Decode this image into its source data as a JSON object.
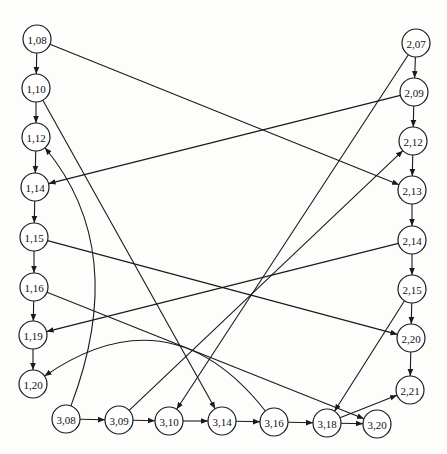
{
  "diagram": {
    "type": "directed-graph",
    "node_radius": 14,
    "colors": {
      "background": "#fdfdfc",
      "stroke": "#1a1a1a",
      "node_fill": "#ffffff",
      "text": "#111111"
    },
    "nodes": [
      {
        "id": "1,08",
        "label": "1,08",
        "x": 37,
        "y": 39
      },
      {
        "id": "1,10",
        "label": "1,10",
        "x": 36,
        "y": 88
      },
      {
        "id": "1,12",
        "label": "1,12",
        "x": 36,
        "y": 137
      },
      {
        "id": "1,14",
        "label": "1,14",
        "x": 35,
        "y": 187
      },
      {
        "id": "1,15",
        "label": "1,15",
        "x": 34,
        "y": 237
      },
      {
        "id": "1,16",
        "label": "1,16",
        "x": 34,
        "y": 287
      },
      {
        "id": "1,19",
        "label": "1,19",
        "x": 33,
        "y": 335
      },
      {
        "id": "1,20",
        "label": "1,20",
        "x": 33,
        "y": 384
      },
      {
        "id": "2,07",
        "label": "2,07",
        "x": 416,
        "y": 43
      },
      {
        "id": "2,09",
        "label": "2,09",
        "x": 414,
        "y": 92
      },
      {
        "id": "2,12",
        "label": "2,12",
        "x": 413,
        "y": 141
      },
      {
        "id": "2,13",
        "label": "2,13",
        "x": 412,
        "y": 190
      },
      {
        "id": "2,14",
        "label": "2,14",
        "x": 412,
        "y": 240
      },
      {
        "id": "2,15",
        "label": "2,15",
        "x": 412,
        "y": 289
      },
      {
        "id": "2,20",
        "label": "2,20",
        "x": 411,
        "y": 338
      },
      {
        "id": "2,21",
        "label": "2,21",
        "x": 410,
        "y": 390
      },
      {
        "id": "3,08",
        "label": "3,08",
        "x": 66,
        "y": 419
      },
      {
        "id": "3,09",
        "label": "3,09",
        "x": 119,
        "y": 420
      },
      {
        "id": "3,10",
        "label": "3,10",
        "x": 169,
        "y": 421
      },
      {
        "id": "3,14",
        "label": "3,14",
        "x": 222,
        "y": 421
      },
      {
        "id": "3,16",
        "label": "3,16",
        "x": 274,
        "y": 422
      },
      {
        "id": "3,18",
        "label": "3,18",
        "x": 327,
        "y": 423
      },
      {
        "id": "3,20",
        "label": "3,20",
        "x": 377,
        "y": 424
      }
    ],
    "edges": [
      {
        "from": "1,08",
        "to": "1,10"
      },
      {
        "from": "1,10",
        "to": "1,12"
      },
      {
        "from": "1,12",
        "to": "1,14"
      },
      {
        "from": "1,14",
        "to": "1,15"
      },
      {
        "from": "1,15",
        "to": "1,16"
      },
      {
        "from": "1,16",
        "to": "1,19"
      },
      {
        "from": "1,19",
        "to": "1,20"
      },
      {
        "from": "2,07",
        "to": "2,09"
      },
      {
        "from": "2,09",
        "to": "2,12"
      },
      {
        "from": "2,12",
        "to": "2,13"
      },
      {
        "from": "2,13",
        "to": "2,14"
      },
      {
        "from": "2,14",
        "to": "2,15"
      },
      {
        "from": "2,15",
        "to": "2,20"
      },
      {
        "from": "2,20",
        "to": "2,21"
      },
      {
        "from": "3,08",
        "to": "3,09"
      },
      {
        "from": "3,09",
        "to": "3,10"
      },
      {
        "from": "3,10",
        "to": "3,14"
      },
      {
        "from": "3,14",
        "to": "3,16"
      },
      {
        "from": "3,16",
        "to": "3,18"
      },
      {
        "from": "3,18",
        "to": "3,20"
      },
      {
        "from": "1,08",
        "to": "2,13"
      },
      {
        "from": "1,10",
        "to": "3,14"
      },
      {
        "from": "2,09",
        "to": "1,14"
      },
      {
        "from": "2,07",
        "to": "3,10"
      },
      {
        "from": "3,09",
        "to": "2,12"
      },
      {
        "from": "1,15",
        "to": "2,20"
      },
      {
        "from": "1,16",
        "to": "3,20"
      },
      {
        "from": "2,14",
        "to": "1,19"
      },
      {
        "from": "2,15",
        "to": "3,18"
      },
      {
        "from": "3,18",
        "to": "2,21"
      },
      {
        "from": "3,08",
        "to": "1,12",
        "curve": {
          "cx": 130,
          "cy": 250
        }
      },
      {
        "from": "3,16",
        "to": "1,20",
        "curve": {
          "cx": 170,
          "cy": 290
        }
      }
    ]
  }
}
